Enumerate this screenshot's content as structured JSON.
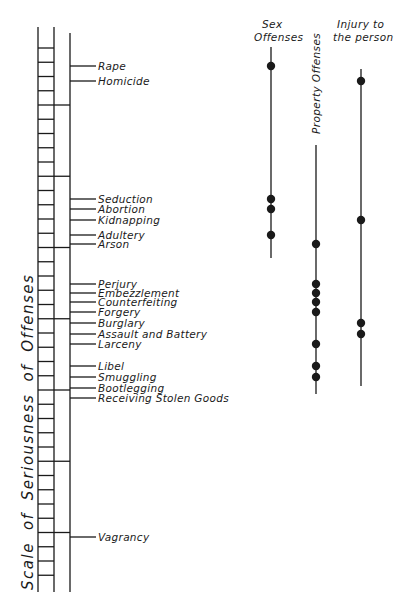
{
  "diagram": {
    "type": "scale-of-seriousness",
    "axis_title": "Scale of Seriousness of Offenses",
    "columns": [
      {
        "id": "sex",
        "header_lines": [
          "Sex",
          "Offenses"
        ],
        "x": 271,
        "line_top": 47,
        "line_bottom": 258,
        "dots": [
          "Rape",
          "Seduction",
          "Abortion",
          "Adultery"
        ]
      },
      {
        "id": "property",
        "header_vertical": "Property Offenses",
        "x": 316,
        "line_top": 145,
        "line_bottom": 394,
        "dots": [
          "Arson",
          "Perjury",
          "Embezzlement",
          "Counterfeiting",
          "Forgery",
          "Larceny",
          "Libel",
          "Smuggling"
        ]
      },
      {
        "id": "injury",
        "header_lines": [
          "Injury to",
          "the person"
        ],
        "x": 361,
        "line_top": 69,
        "line_bottom": 386,
        "dots": [
          "Homicide",
          "Kidnapping",
          "Burglary",
          "Assault and Battery"
        ]
      }
    ],
    "offenses": [
      {
        "label": "Rape",
        "y": 66
      },
      {
        "label": "Homicide",
        "y": 81
      },
      {
        "label": "Seduction",
        "y": 199
      },
      {
        "label": "Abortion",
        "y": 209
      },
      {
        "label": "Kidnapping",
        "y": 220
      },
      {
        "label": "Adultery",
        "y": 235
      },
      {
        "label": "Arson",
        "y": 244
      },
      {
        "label": "Perjury",
        "y": 284
      },
      {
        "label": "Embezzlement",
        "y": 293
      },
      {
        "label": "Counterfeiting",
        "y": 302
      },
      {
        "label": "Forgery",
        "y": 312
      },
      {
        "label": "Burglary",
        "y": 323
      },
      {
        "label": "Assault and Battery",
        "y": 334
      },
      {
        "label": "Larceny",
        "y": 344
      },
      {
        "label": "Libel",
        "y": 366
      },
      {
        "label": "Smuggling",
        "y": 377
      },
      {
        "label": "Bootlegging",
        "y": 388
      },
      {
        "label": "Receiving Stolen Goods",
        "y": 398
      },
      {
        "label": "Vagrancy",
        "y": 537
      }
    ]
  },
  "chart_data": {
    "type": "scatter",
    "title": "Scale of Seriousness of Offenses",
    "xlabel": "",
    "ylabel": "Scale of Seriousness of Offenses",
    "categories": [
      "Sex Offenses",
      "Property Offenses",
      "Injury to the person"
    ],
    "offense_order_most_to_least_serious": [
      "Rape",
      "Homicide",
      "Seduction",
      "Abortion",
      "Kidnapping",
      "Adultery",
      "Arson",
      "Perjury",
      "Embezzlement",
      "Counterfeiting",
      "Forgery",
      "Burglary",
      "Assault and Battery",
      "Larceny",
      "Libel",
      "Smuggling",
      "Bootlegging",
      "Receiving Stolen Goods",
      "Vagrancy"
    ],
    "series": [
      {
        "name": "Sex Offenses",
        "points": [
          "Rape",
          "Seduction",
          "Abortion",
          "Adultery"
        ]
      },
      {
        "name": "Property Offenses",
        "points": [
          "Arson",
          "Perjury",
          "Embezzlement",
          "Counterfeiting",
          "Forgery",
          "Larceny",
          "Libel",
          "Smuggling"
        ]
      },
      {
        "name": "Injury to the person",
        "points": [
          "Homicide",
          "Kidnapping",
          "Burglary",
          "Assault and Battery"
        ]
      }
    ],
    "grid": false,
    "legend": "column headers at top"
  }
}
